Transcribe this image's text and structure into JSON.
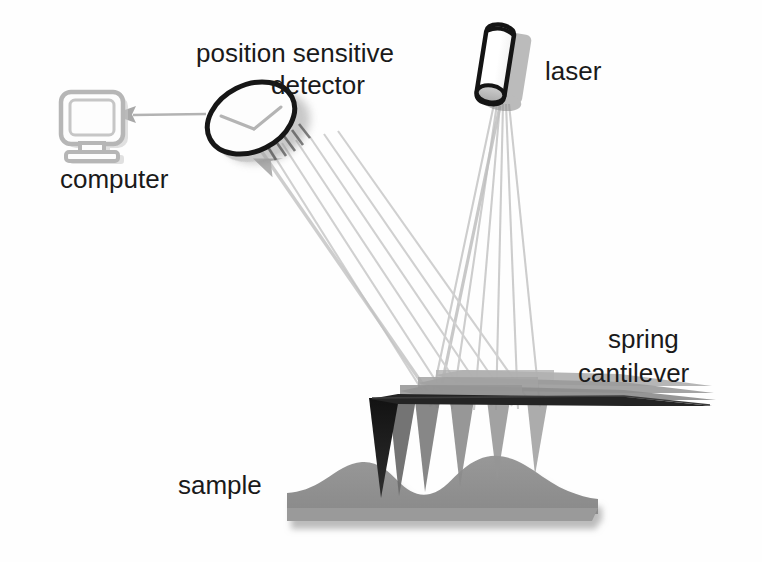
{
  "diagram": {
    "background_color": "#fefefe",
    "width": 762,
    "height": 562,
    "labels": {
      "computer": "computer",
      "detector_line1": "position sensitive",
      "detector_line2": "detector",
      "laser": "laser",
      "cantilever_line1": "spring",
      "cantilever_line2": "cantilever",
      "sample": "sample"
    },
    "components": [
      {
        "name": "computer",
        "icon": "crt-monitor-icon",
        "label": "computer",
        "color": "#b8b8b8",
        "shadow": "#c9c9c9"
      },
      {
        "name": "position-sensitive-detector",
        "icon": "ellipse-detector-icon",
        "label": "position sensitive detector",
        "color": "#1a1a1a",
        "fill": "#fdfdfd",
        "shadow": "#9a9a9a"
      },
      {
        "name": "laser",
        "icon": "cylinder-laser-icon",
        "label": "laser",
        "color": "#1a1a1a",
        "fill": "#ffffff",
        "cap_fill": "#b6b6b6",
        "shadow": "#8e8e8e"
      },
      {
        "name": "spring-cantilever",
        "icon": "cantilever-beam-icon",
        "label": "spring cantilever",
        "color": "#2b2b2b",
        "ghost_color": "#8c8c8c"
      },
      {
        "name": "sample",
        "icon": "sample-surface-icon",
        "label": "sample",
        "color": "#8d8d8d",
        "shadow": "#bdbdbd"
      },
      {
        "name": "signal-arrow",
        "icon": "arrow-left-icon",
        "color": "#a8a8a8"
      }
    ],
    "beams": {
      "incident": {
        "name": "incident-laser-beam",
        "from": "laser",
        "to": "spring-cantilever",
        "ray_count": 6,
        "color": "#cfcfcf"
      },
      "reflected": {
        "name": "reflected-laser-beam",
        "from": "spring-cantilever",
        "to": "position-sensitive-detector",
        "ray_count": 6,
        "color": "#d2d2d2"
      }
    },
    "colors": {
      "ink": "#1a1a1a",
      "gray_mid": "#8d8d8d",
      "gray_light": "#cfcfcf",
      "gray_shadow": "#b5b5b5",
      "white": "#ffffff"
    }
  }
}
